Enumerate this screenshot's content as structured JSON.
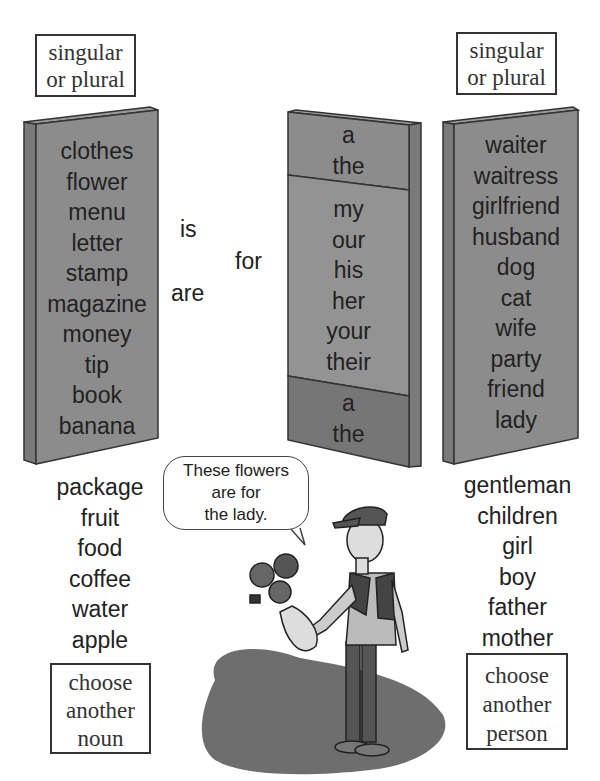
{
  "left_header": {
    "line1": "singular",
    "line2": "or plural"
  },
  "right_header": {
    "line1": "singular",
    "line2": "or plural"
  },
  "nouns_panel": [
    "clothes",
    "flower",
    "menu",
    "letter",
    "stamp",
    "magazine",
    "money",
    "tip",
    "book",
    "banana"
  ],
  "verbs": {
    "is": "is",
    "are": "are"
  },
  "preposition": "for",
  "determiners_panel": {
    "top": [
      "a",
      "the"
    ],
    "middle": [
      "my",
      "our",
      "his",
      "her",
      "your",
      "their"
    ],
    "bottom": [
      "a",
      "the"
    ]
  },
  "people_panel": [
    "waiter",
    "waitress",
    "girlfriend",
    "husband",
    "dog",
    "cat",
    "wife",
    "party",
    "friend",
    "lady"
  ],
  "extra_nouns": [
    "package",
    "fruit",
    "food",
    "coffee",
    "water",
    "apple"
  ],
  "extra_people": [
    "gentleman",
    "children",
    "girl",
    "boy",
    "father",
    "mother"
  ],
  "choose_noun": {
    "line1": "choose",
    "line2": "another",
    "line3": "noun"
  },
  "choose_person": {
    "line1": "choose",
    "line2": "another",
    "line3": "person"
  },
  "speech_bubble": {
    "line1": "These flowers",
    "line2": "are for",
    "line3": "the lady."
  },
  "colors": {
    "panel_face": "#8c8c8c",
    "panel_side": "#7a7a7a",
    "panel_dark": "#767676",
    "shadow": "#6e6e6e",
    "outline": "#333333"
  }
}
